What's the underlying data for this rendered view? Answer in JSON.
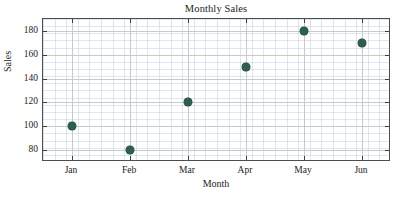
{
  "chart_data": {
    "type": "scatter",
    "title": "Monthly Sales",
    "xlabel": "Month",
    "ylabel": "Sales",
    "categories": [
      "Jan",
      "Feb",
      "Mar",
      "Apr",
      "May",
      "Jun"
    ],
    "values": [
      100,
      80,
      120,
      150,
      180,
      170
    ],
    "series": [
      {
        "name": "Sales",
        "values": [
          100,
          80,
          120,
          150,
          180,
          170
        ]
      }
    ],
    "points": [
      {
        "x": "Jan",
        "y": 100
      },
      {
        "x": "Feb",
        "y": 80
      },
      {
        "x": "Mar",
        "y": 120
      },
      {
        "x": "Apr",
        "y": 150
      },
      {
        "x": "May",
        "y": 180
      },
      {
        "x": "Jun",
        "y": 170
      }
    ],
    "ylim": [
      70,
      190
    ],
    "xlim": [
      0.5,
      6.5
    ],
    "ytick_labels": [
      "80",
      "100",
      "120",
      "140",
      "160",
      "180"
    ],
    "yticks": [
      80,
      100,
      120,
      140,
      160,
      180
    ],
    "xtick_labels": [
      "Jan",
      "Feb",
      "Mar",
      "Apr",
      "May",
      "Jun"
    ],
    "grid": true,
    "minor_grid": true,
    "legend": null,
    "legend_position": "none",
    "marker_color": "#2f5d52",
    "marker_shape": "circle",
    "axis_color": "#4d4d4d",
    "gridline_color": "#c9c9c9",
    "minor_gridline_color": "#96afcd",
    "background_color": "#ffffff"
  }
}
